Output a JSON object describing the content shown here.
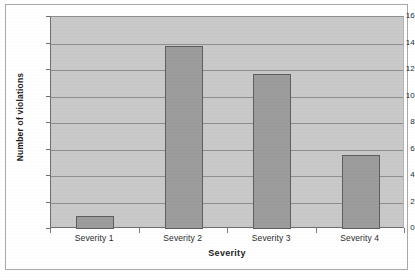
{
  "chart_data": {
    "type": "bar",
    "title": "",
    "categories": [
      "Severity 1",
      "Severity 2",
      "Severity 3",
      "Severity 4"
    ],
    "values": [
      1.0,
      13.8,
      11.7,
      5.6
    ],
    "xlabel": "Severity",
    "ylabel": "Number of violations",
    "ylim": [
      0,
      16
    ],
    "ytick_labels": [
      "16",
      "14",
      "12",
      "10",
      "8",
      "6",
      "4",
      "2",
      "0"
    ],
    "ytick_values": [
      16,
      14,
      12,
      10,
      8,
      6,
      4,
      2,
      0
    ],
    "grid": true,
    "legend": "none",
    "series": [
      {
        "name": "Number of violations",
        "values": [
          1.0,
          13.8,
          11.7,
          5.6
        ]
      }
    ],
    "colors": {
      "bar_fill": "#9c9c9c",
      "bar_border": "#5e5e5e",
      "plot_background": "#c9c9c9",
      "gridline": "#8e8e8e",
      "axis": "#6f6f6f",
      "text": "#2a2a2a",
      "page_background": "#ffffff",
      "frame_border": "#a8a8a8"
    }
  }
}
